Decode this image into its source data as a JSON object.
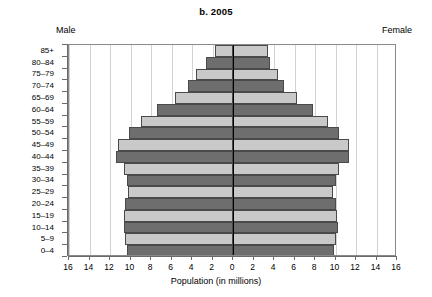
{
  "chart_data": {
    "type": "bar",
    "subtype": "population-pyramid",
    "title": "b. 2005",
    "xlabel": "Population (in millions)",
    "ylabel": "",
    "categories": [
      "0–4",
      "5–9",
      "10–14",
      "15–19",
      "20–24",
      "25–29",
      "30–34",
      "35–39",
      "40–44",
      "45–49",
      "50–54",
      "55–59",
      "60–64",
      "65–69",
      "70–74",
      "75–79",
      "80–84",
      "85+"
    ],
    "series": [
      {
        "name": "Male",
        "side": "left",
        "values": [
          10.3,
          10.5,
          10.6,
          10.6,
          10.5,
          10.2,
          10.3,
          10.6,
          11.4,
          11.2,
          10.1,
          9.0,
          7.4,
          5.7,
          4.4,
          3.6,
          2.6,
          1.8
        ]
      },
      {
        "name": "Female",
        "side": "right",
        "values": [
          9.9,
          10.0,
          10.2,
          10.1,
          10.0,
          9.8,
          10.0,
          10.3,
          11.3,
          11.3,
          10.3,
          9.3,
          7.8,
          6.2,
          5.0,
          4.4,
          3.6,
          3.4
        ]
      }
    ],
    "xlim": [
      -16,
      16
    ],
    "xticks": [
      "16",
      "14",
      "12",
      "10",
      "8",
      "6",
      "4",
      "2",
      "0",
      "2",
      "4",
      "6",
      "8",
      "10",
      "12",
      "14",
      "16"
    ],
    "xtick_values": [
      -16,
      -14,
      -12,
      -10,
      -8,
      -6,
      -4,
      -2,
      0,
      2,
      4,
      6,
      8,
      10,
      12,
      14,
      16
    ],
    "grid": true,
    "legend_position": "top-corners",
    "left_header": "Male",
    "right_header": "Female",
    "bar_colors": {
      "dark": "#6e6e6e",
      "light": "#c9c9c9",
      "border": "#4a4a4a"
    },
    "axis_color": "#6a6a6a",
    "gridline_color": "#d2d2d2",
    "center_line_color": "#000000",
    "background": "#ffffff",
    "color_pattern_note": "Alternating dark/light bands by age group, both sides matching"
  }
}
